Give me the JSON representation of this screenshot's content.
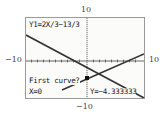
{
  "window": {
    "y_max_label": "10",
    "y_min_label": "−10",
    "x_min_label": "−10",
    "x_max_label": "10"
  },
  "screen": {
    "equation_label": "Y1=2X/3−13/3",
    "prompt": "First curve?",
    "x_readout": "X=0",
    "y_readout": "Y=−4.333333"
  },
  "graph": {
    "xmin": -10,
    "xmax": 10,
    "ymin": -10,
    "ymax": 10,
    "curves": [
      {
        "name": "Y1",
        "expression": "2X/3-13/3",
        "slope": 0.6667,
        "intercept": -4.3333
      },
      {
        "name": "Y2",
        "slope": -0.6,
        "intercept": -1.5
      }
    ],
    "cursor": {
      "x": 0,
      "y": -4.333333
    },
    "line_color": "#333333"
  }
}
